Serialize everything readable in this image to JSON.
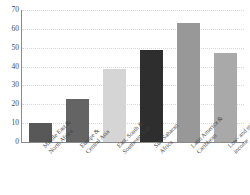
{
  "chart_data": {
    "type": "bar",
    "title": "",
    "subtitle": "",
    "xlabel": "",
    "ylabel": "",
    "ylim": [
      0,
      70
    ],
    "ytick_step": 10,
    "yticks": [
      70,
      60,
      50,
      40,
      30,
      20,
      10,
      0
    ],
    "grid": true,
    "grid_axis": "y",
    "legend": false,
    "legend_position": "none",
    "categories": [
      "Middle East & North Africa",
      "Europe & Central Asia",
      "East, South & Southeast Asia",
      "Sub-Saharan Africa",
      "Latin America & Caribbean",
      "Low- and middle-income"
    ],
    "category_lines": [
      [
        "Middle East &",
        "North Africa"
      ],
      [
        "Europe &",
        "Central Asia"
      ],
      [
        "East, South &",
        "Southeast Asia"
      ],
      [
        "Sub-Saharan",
        "Africa"
      ],
      [
        "Latin America &",
        "Caribbean"
      ],
      [
        "Low- and middle-",
        "income"
      ]
    ],
    "values": [
      10,
      23,
      38.5,
      49,
      63,
      47
    ],
    "bar_colors": [
      "#585858",
      "#646464",
      "#d5d5d5",
      "#2e2e2e",
      "#989898",
      "#a9a9a9"
    ]
  },
  "style": {
    "background": "#ffffff",
    "axis_color": "#8a8a8a",
    "grid_color": "#d8d8d8",
    "tick_label_color": "#4a4a4a",
    "x_label_color": "#3f3f3f"
  }
}
